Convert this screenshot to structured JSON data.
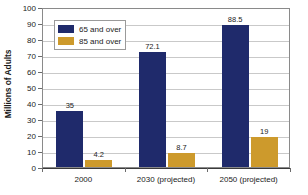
{
  "chart_data": {
    "type": "bar",
    "title": "",
    "xlabel": "",
    "ylabel": "Millions of Adults",
    "categories": [
      "2000",
      "2030 (projected)",
      "2050 (projected)"
    ],
    "series": [
      {
        "name": "65 and over",
        "color": "#1f2a6b",
        "values": [
          35,
          72.1,
          88.5
        ],
        "labels": [
          "35",
          "72.1",
          "88.5"
        ]
      },
      {
        "name": "85 and over",
        "color": "#cd9a2c",
        "values": [
          4.2,
          8.7,
          19
        ],
        "labels": [
          "4.2",
          "8.7",
          "19"
        ]
      }
    ],
    "ylim": [
      0,
      100
    ],
    "ytick_step": 10,
    "ytick_labels": [
      "0",
      "10",
      "20",
      "30",
      "40",
      "50",
      "60",
      "70",
      "80",
      "90",
      "100"
    ],
    "grid": true,
    "grid_color": "#c9c9c9",
    "legend_position": "upper-left-inside",
    "plot_border_color": "#8a8a8a",
    "axis_color": "#3a3a3a",
    "background": "#ffffff"
  }
}
